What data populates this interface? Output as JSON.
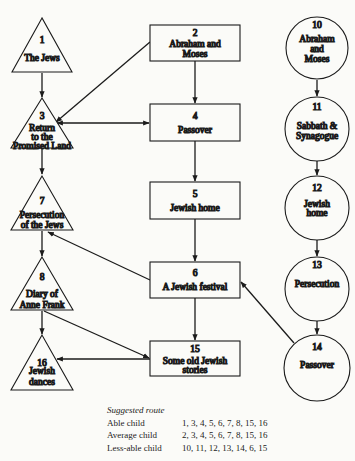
{
  "nodes": {
    "n1": {
      "shape": "triangle",
      "number": "1",
      "lines": [
        "The Jews"
      ]
    },
    "n2": {
      "shape": "rectangle",
      "number": "2",
      "lines": [
        "Abraham and",
        "Moses"
      ]
    },
    "n3": {
      "shape": "triangle",
      "number": "3",
      "lines": [
        "Return",
        "to the",
        "Promised Land"
      ]
    },
    "n4": {
      "shape": "rectangle",
      "number": "4",
      "lines": [
        "Passover"
      ]
    },
    "n5": {
      "shape": "rectangle",
      "number": "5",
      "lines": [
        "Jewish home"
      ]
    },
    "n6": {
      "shape": "rectangle",
      "number": "6",
      "lines": [
        "A Jewish festival"
      ]
    },
    "n7": {
      "shape": "triangle",
      "number": "7",
      "lines": [
        "Persecution",
        "of the Jews"
      ]
    },
    "n8": {
      "shape": "triangle",
      "number": "8",
      "lines": [
        "Diary of",
        "Anne Frank"
      ]
    },
    "n10": {
      "shape": "circle",
      "number": "10",
      "lines": [
        "Abraham",
        "and",
        "Moses"
      ]
    },
    "n11": {
      "shape": "circle",
      "number": "11",
      "lines": [
        "Sabbath &",
        "Synagogue"
      ]
    },
    "n12": {
      "shape": "circle",
      "number": "12",
      "lines": [
        "Jewish",
        "home"
      ]
    },
    "n13": {
      "shape": "circle",
      "number": "13",
      "lines": [
        "Persecution"
      ]
    },
    "n14": {
      "shape": "circle",
      "number": "14",
      "lines": [
        "Passover"
      ]
    },
    "n15": {
      "shape": "rectangle",
      "number": "15",
      "lines": [
        "Some old Jewish",
        "stories"
      ]
    },
    "n16": {
      "shape": "triangle",
      "number": "16",
      "lines": [
        "Jewish",
        "dances"
      ]
    }
  },
  "edges": [
    {
      "from": "1",
      "to": "3"
    },
    {
      "from": "2",
      "to": "3"
    },
    {
      "from": "2",
      "to": "4"
    },
    {
      "from": "3",
      "to": "4",
      "bidirectional": true
    },
    {
      "from": "3",
      "to": "7"
    },
    {
      "from": "4",
      "to": "5"
    },
    {
      "from": "5",
      "to": "6"
    },
    {
      "from": "6",
      "to": "7"
    },
    {
      "from": "6",
      "to": "15"
    },
    {
      "from": "7",
      "to": "8"
    },
    {
      "from": "8",
      "to": "16"
    },
    {
      "from": "8",
      "to": "15"
    },
    {
      "from": "15",
      "to": "16"
    },
    {
      "from": "10",
      "to": "11"
    },
    {
      "from": "11",
      "to": "12"
    },
    {
      "from": "12",
      "to": "13"
    },
    {
      "from": "13",
      "to": "14"
    },
    {
      "from": "14",
      "to": "6"
    }
  ],
  "legend": {
    "title": "Suggested route",
    "routes": [
      {
        "label": "Able child",
        "sequence": "1, 3, 4, 5, 6, 7, 8, 15, 16"
      },
      {
        "label": "Average child",
        "sequence": "2, 3, 4, 5, 6, 7, 8, 15, 16"
      },
      {
        "label": "Less-able child",
        "sequence": "10, 11, 12, 13, 14, 6, 15"
      }
    ]
  },
  "colors": {
    "ink": "#1b1b1b",
    "paper": "#fbfbf8"
  }
}
